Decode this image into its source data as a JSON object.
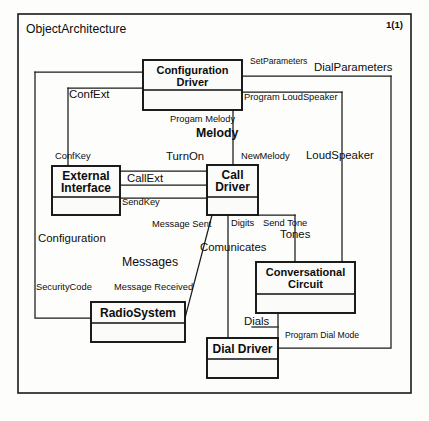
{
  "diagram": {
    "title": "ObjectArchitecture",
    "page_indicator": "1(1)",
    "type": "uml-object-architecture",
    "colors": {
      "line": "#1a1a1a",
      "text": "#0d0d0d",
      "background": "#fdfdfb"
    }
  },
  "blocks": [
    {
      "id": "configuration-driver",
      "line1": "Configuration",
      "line2": "Driver",
      "x": 143,
      "y": 60,
      "w": 99,
      "h": 50,
      "div": 30
    },
    {
      "id": "external-interface",
      "line1": "External",
      "line2": "Interface",
      "x": 52,
      "y": 166,
      "w": 68,
      "h": 49,
      "div": 31
    },
    {
      "id": "call-driver",
      "line1": "Call",
      "line2": "Driver",
      "x": 207,
      "y": 165,
      "w": 51,
      "h": 50,
      "div": 32
    },
    {
      "id": "conversational-circuit",
      "line1": "Conversational",
      "line2": "Circuit",
      "x": 256,
      "y": 262,
      "w": 99,
      "h": 51,
      "div": 32
    },
    {
      "id": "radio-system",
      "line1": "RadioSystem",
      "line2": "",
      "x": 91,
      "y": 302,
      "w": 94,
      "h": 40,
      "div": 21
    },
    {
      "id": "dial-driver",
      "line1": "Dial Driver",
      "line2": "",
      "x": 207,
      "y": 338,
      "w": 71,
      "h": 40,
      "div": 21
    }
  ],
  "signals": [
    {
      "id": "set-parameters",
      "text": "SetParameters",
      "x": 250,
      "y": 64,
      "size": "tiny"
    },
    {
      "id": "dial-parameters",
      "text": "DialParameters",
      "x": 314,
      "y": 71,
      "size": "med"
    },
    {
      "id": "program-loudspeaker",
      "text": "Program LoudSpeaker",
      "x": 244,
      "y": 100,
      "size": "small"
    },
    {
      "id": "conf-ext",
      "text": "ConfExt",
      "x": 69,
      "y": 98,
      "size": "med"
    },
    {
      "id": "progam-melody",
      "text": "Progam Melody",
      "x": 170,
      "y": 122,
      "size": "small"
    },
    {
      "id": "melody",
      "text": "Melody",
      "x": 196,
      "y": 137,
      "size": "big",
      "bold": true
    },
    {
      "id": "conf-key",
      "text": "ConfKey",
      "x": 55,
      "y": 159,
      "size": "small"
    },
    {
      "id": "turn-on",
      "text": "TurnOn",
      "x": 166,
      "y": 160,
      "size": "med"
    },
    {
      "id": "new-melody",
      "text": "NewMelody",
      "x": 241,
      "y": 159,
      "size": "small"
    },
    {
      "id": "loud-speaker",
      "text": "LoudSpeaker",
      "x": 306,
      "y": 159,
      "size": "med"
    },
    {
      "id": "call-ext",
      "text": "CallExt",
      "x": 127,
      "y": 182,
      "size": "med"
    },
    {
      "id": "send-key",
      "text": "SendKey",
      "x": 122,
      "y": 205,
      "size": "small"
    },
    {
      "id": "send-tone",
      "text": "Send Tone",
      "x": 263,
      "y": 226,
      "size": "small"
    },
    {
      "id": "message-sent",
      "text": "Message Sent",
      "x": 152,
      "y": 227,
      "size": "small"
    },
    {
      "id": "digits",
      "text": "Digits",
      "x": 231,
      "y": 226,
      "size": "small"
    },
    {
      "id": "tones",
      "text": "Tones",
      "x": 280,
      "y": 238,
      "size": "med"
    },
    {
      "id": "comunicates",
      "text": "Comunicates",
      "x": 200,
      "y": 251,
      "size": "med"
    },
    {
      "id": "configuration",
      "text": "Configuration",
      "x": 38,
      "y": 242,
      "size": "med"
    },
    {
      "id": "messages",
      "text": "Messages",
      "x": 122,
      "y": 266,
      "size": "big"
    },
    {
      "id": "security-code",
      "text": "SecurityCode",
      "x": 36,
      "y": 290,
      "size": "small"
    },
    {
      "id": "message-received",
      "text": "Message Received",
      "x": 114,
      "y": 290,
      "size": "small"
    },
    {
      "id": "dials",
      "text": "Dials",
      "x": 244,
      "y": 325,
      "size": "med"
    },
    {
      "id": "program-dial-mode",
      "text": "Program Dial Mode",
      "x": 285,
      "y": 338,
      "size": "tiny"
    }
  ],
  "connectors": [
    {
      "id": "wire-conf-top-right",
      "d": "M242 76 L391 76"
    },
    {
      "id": "wire-dial-parameters",
      "d": "M391 76 L391 348 L278 348"
    },
    {
      "id": "wire-program-loudspeaker",
      "d": "M242 92 L342 92"
    },
    {
      "id": "wire-loudspeaker-down",
      "d": "M342 92 L342 262"
    },
    {
      "id": "wire-confext-left",
      "d": "M143 72 L35 72"
    },
    {
      "id": "wire-confext-down",
      "d": "M35 72 L35 318 L91 318"
    },
    {
      "id": "wire-confkey-left",
      "d": "M143 88 L68 88"
    },
    {
      "id": "wire-confkey-down",
      "d": "M68 88 L68 166"
    },
    {
      "id": "wire-melody-down",
      "d": "M233 110 L233 165"
    },
    {
      "id": "wire-turnon-left",
      "d": "M207 171 L120 171"
    },
    {
      "id": "wire-callext-line",
      "d": "M207 185 L120 185"
    },
    {
      "id": "wire-sendkey-line",
      "d": "M207 198 L120 198"
    },
    {
      "id": "wire-send-tone",
      "d": "M258 215 L295 215"
    },
    {
      "id": "wire-tones-down",
      "d": "M295 215 L295 262"
    },
    {
      "id": "wire-message-sent",
      "d": "M212 215 L185 318"
    },
    {
      "id": "wire-comunicates-down",
      "d": "M228 215 L228 358"
    },
    {
      "id": "wire-dials-down",
      "d": "M278 313 L278 338"
    },
    {
      "id": "wire-dials-left",
      "d": "M278 327 L252 327"
    }
  ]
}
